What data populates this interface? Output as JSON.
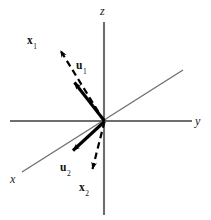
{
  "figure": {
    "background_color": "#ffffff",
    "axis_color": "#6e6e6e",
    "vector_color": "#000000",
    "origin": {
      "x": 104,
      "y": 121
    }
  },
  "axes": [
    {
      "name": "z-axis",
      "label": "z",
      "orientation": "vertical",
      "from": {
        "x": 104,
        "y": 22
      },
      "to": {
        "x": 104,
        "y": 215
      },
      "label_pos": {
        "x": 100,
        "y": 6
      }
    },
    {
      "name": "y-axis",
      "label": "y",
      "orientation": "horizontal",
      "from": {
        "x": 10,
        "y": 121
      },
      "to": {
        "x": 192,
        "y": 121
      },
      "label_pos": {
        "x": 194,
        "y": 117
      }
    },
    {
      "name": "x-axis",
      "label": "x",
      "orientation": "diagonal",
      "from": {
        "x": 183,
        "y": 70
      },
      "to": {
        "x": 22,
        "y": 172
      },
      "label_pos": {
        "x": 10,
        "y": 174
      }
    }
  ],
  "vectors": [
    {
      "name": "x1",
      "letter": "x",
      "subscript": "1",
      "style": "dashed",
      "from": {
        "x": 104,
        "y": 121
      },
      "to": {
        "x": 59,
        "y": 49
      },
      "label_pos": {
        "x": 27,
        "y": 36
      },
      "description": "dashed arrow pointing up-left from origin"
    },
    {
      "name": "u1",
      "letter": "u",
      "subscript": "1",
      "style": "solid",
      "from": {
        "x": 104,
        "y": 121
      },
      "to": {
        "x": 73,
        "y": 81
      },
      "label_pos": {
        "x": 76,
        "y": 61
      },
      "description": "solid thick arrow pointing up-left from origin"
    },
    {
      "name": "u2",
      "letter": "u",
      "subscript": "2",
      "style": "solid",
      "from": {
        "x": 104,
        "y": 121
      },
      "to": {
        "x": 71,
        "y": 152
      },
      "label_pos": {
        "x": 60,
        "y": 163
      },
      "description": "solid thick arrow pointing down-left from origin"
    },
    {
      "name": "x2",
      "letter": "x",
      "subscript": "2",
      "style": "dashed",
      "from": {
        "x": 104,
        "y": 121
      },
      "to": {
        "x": 91,
        "y": 171
      },
      "label_pos": {
        "x": 79,
        "y": 183
      },
      "description": "dashed arrow pointing down-left from origin"
    }
  ]
}
